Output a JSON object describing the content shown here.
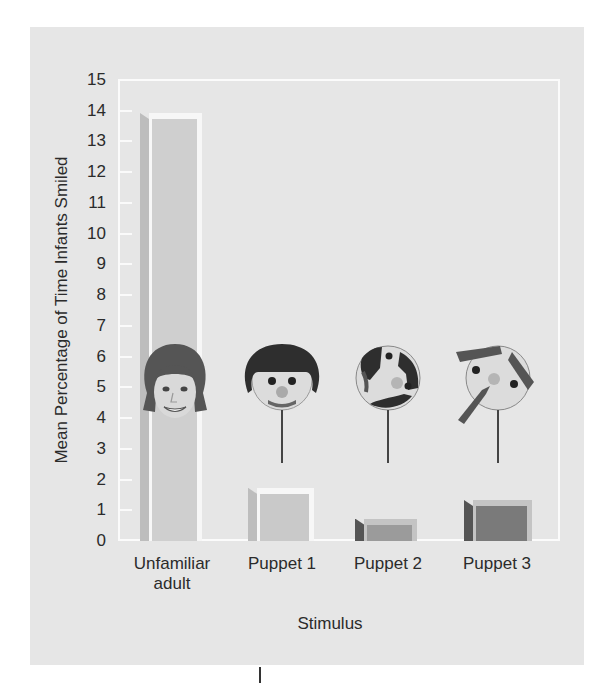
{
  "chart_data": {
    "type": "bar",
    "title": "",
    "xlabel": "Stimulus",
    "ylabel": "Mean Percentage of Time Infants Smiled",
    "categories": [
      "Unfamiliar adult",
      "Puppet 1",
      "Puppet 2",
      "Puppet 3"
    ],
    "category_lines": [
      [
        "Unfamiliar",
        "adult"
      ],
      [
        "Puppet 1"
      ],
      [
        "Puppet 2"
      ],
      [
        "Puppet 3"
      ]
    ],
    "values": [
      13.8,
      1.6,
      0.6,
      1.2
    ],
    "ylim": [
      0,
      15
    ],
    "yticks": [
      0,
      1,
      2,
      3,
      4,
      5,
      6,
      7,
      8,
      9,
      10,
      11,
      12,
      13,
      14,
      15
    ],
    "grid": false,
    "legend": null,
    "bar_colors": [
      "#cfcfcf",
      "#c9c9c9",
      "#9b9b9b",
      "#7a7a7a"
    ],
    "stimulus_images": [
      "human-face",
      "puppet-face-normal",
      "puppet-face-scrambled",
      "puppet-face-rearranged"
    ]
  },
  "colors": {
    "panel": "#e6e6e6",
    "frame": "#fbfbfb",
    "text": "#2b2b2b"
  }
}
